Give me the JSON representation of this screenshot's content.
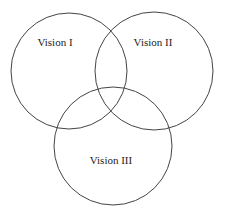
{
  "diagram": {
    "type": "venn",
    "style": {
      "stroke_color": "#444444",
      "text_color": "#222222",
      "background": "#ffffff"
    },
    "sets": [
      {
        "label": "Vision I",
        "cx": 69,
        "cy": 71,
        "r": 58,
        "label_x": 55,
        "label_y": 46
      },
      {
        "label": "Vision II",
        "cx": 154,
        "cy": 71,
        "r": 59,
        "label_x": 153,
        "label_y": 46
      },
      {
        "label": "Vision III",
        "cx": 113,
        "cy": 146,
        "r": 59,
        "label_x": 111,
        "label_y": 164
      }
    ]
  }
}
